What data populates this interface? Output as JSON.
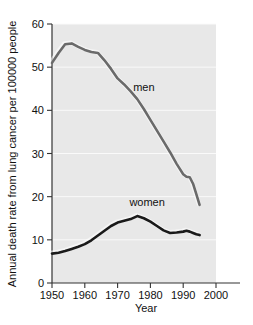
{
  "chart_data": {
    "type": "line",
    "title": "",
    "xlabel": "Year",
    "ylabel": "Annual death rate from lung cancer per 100000 people",
    "xlim": [
      1950,
      2000
    ],
    "ylim": [
      0,
      60
    ],
    "xticks": [
      "1950",
      "1960",
      "1970",
      "1980",
      "1990",
      "2000"
    ],
    "xtick_values": [
      1950,
      1960,
      1970,
      1980,
      1990,
      2000
    ],
    "yticks": [
      "0",
      "10",
      "20",
      "30",
      "40",
      "50",
      "60"
    ],
    "ytick_values": [
      0,
      10,
      20,
      30,
      40,
      50,
      60
    ],
    "grid": "horizontal",
    "legend_position": "inline-annotation",
    "plot_background": "#e8e8e8",
    "series": [
      {
        "name": "men",
        "color": "#6a6a6a",
        "label": "men",
        "label_x": 1978,
        "label_y": 44.5,
        "x": [
          1950,
          1952,
          1954,
          1956,
          1958,
          1960,
          1962,
          1964,
          1966,
          1968,
          1970,
          1972,
          1974,
          1976,
          1978,
          1980,
          1982,
          1984,
          1986,
          1988,
          1990,
          1991,
          1992,
          1993,
          1994,
          1995
        ],
        "values": [
          51.0,
          53.3,
          55.3,
          55.5,
          54.7,
          54.0,
          53.5,
          53.3,
          51.6,
          49.6,
          47.4,
          46.0,
          44.4,
          42.6,
          40.3,
          37.8,
          35.3,
          32.8,
          30.3,
          27.6,
          25.2,
          24.6,
          24.5,
          23.0,
          20.6,
          18.1
        ]
      },
      {
        "name": "women",
        "color": "#1a1a1a",
        "label": "women",
        "label_x": 1979,
        "label_y": 17.8,
        "x": [
          1950,
          1952,
          1954,
          1956,
          1958,
          1960,
          1962,
          1964,
          1966,
          1968,
          1970,
          1972,
          1974,
          1976,
          1978,
          1980,
          1982,
          1984,
          1986,
          1988,
          1990,
          1991,
          1992,
          1993,
          1994,
          1995
        ],
        "values": [
          6.8,
          7.0,
          7.4,
          7.9,
          8.4,
          9.0,
          9.9,
          11.0,
          12.1,
          13.2,
          14.0,
          14.4,
          14.8,
          15.5,
          15.0,
          14.2,
          13.2,
          12.2,
          11.6,
          11.7,
          11.9,
          12.1,
          11.9,
          11.6,
          11.3,
          11.1
        ]
      }
    ]
  }
}
